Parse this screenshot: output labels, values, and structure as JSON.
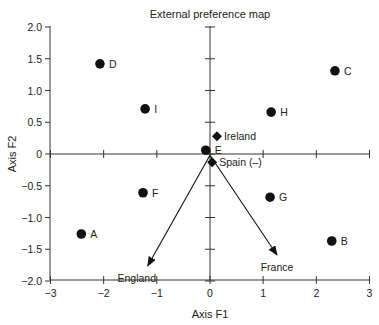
{
  "chart_data": {
    "type": "scatter",
    "title": "External preference map",
    "xlabel": "Axis F1",
    "ylabel": "Axis F2",
    "xlim": [
      -3,
      3
    ],
    "ylim": [
      -2.0,
      2.0
    ],
    "xticks": [
      "-3",
      "-2",
      "-1",
      "0",
      "1",
      "2",
      "3"
    ],
    "yticks": [
      "2.0",
      "1.5",
      "1.0",
      "0.5",
      "0",
      "-0.5",
      "-1.0",
      "-1.5",
      "-2.0"
    ],
    "grid": false,
    "legend": null,
    "series": [
      {
        "name": "Products",
        "marker": "circle",
        "points": [
          {
            "label": "A",
            "x": -2.42,
            "y": -1.26
          },
          {
            "label": "B",
            "x": 2.29,
            "y": -1.37
          },
          {
            "label": "C",
            "x": 2.35,
            "y": 1.31
          },
          {
            "label": "D",
            "x": -2.07,
            "y": 1.42
          },
          {
            "label": "E",
            "x": -0.08,
            "y": 0.06
          },
          {
            "label": "F",
            "x": -1.26,
            "y": -0.61
          },
          {
            "label": "G",
            "x": 1.13,
            "y": -0.68
          },
          {
            "label": "H",
            "x": 1.15,
            "y": 0.66
          },
          {
            "label": "I",
            "x": -1.22,
            "y": 0.71
          }
        ]
      },
      {
        "name": "Consumer segments (ideal points)",
        "marker": "diamond",
        "points": [
          {
            "label": "Ireland",
            "x": 0.13,
            "y": 0.28
          },
          {
            "label": "Spain (–)",
            "x": 0.04,
            "y": -0.13
          }
        ]
      },
      {
        "name": "Consumer segments (vectors)",
        "marker": "arrow",
        "origin": {
          "x": 0.0,
          "y": -0.02
        },
        "points": [
          {
            "label": "England",
            "x": -1.17,
            "y": -1.76
          },
          {
            "label": "France",
            "x": 1.26,
            "y": -1.59
          }
        ]
      }
    ]
  },
  "colors": {
    "marker": "#111111",
    "axis": "#333333",
    "text": "#222222"
  }
}
